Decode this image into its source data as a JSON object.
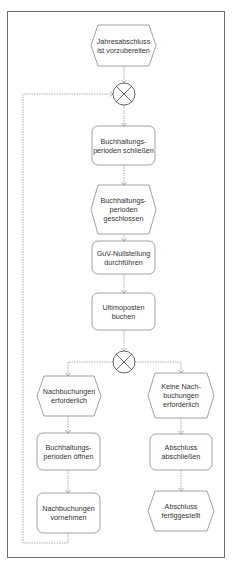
{
  "diagram": {
    "type": "EPC",
    "colors": {
      "stroke": "#8a8a8a",
      "frame": "#6e6e6e",
      "text": "#333333",
      "connector": "#9a9a9a"
    },
    "nodes": {
      "event_start": {
        "kind": "event",
        "label": "Jahresabschluss\nist vorzubereiten"
      },
      "xor_join": {
        "kind": "xor-connector",
        "label": "XOR"
      },
      "func_close_periods": {
        "kind": "function",
        "label": "Buchhaltungs-\nperioden schließen"
      },
      "event_periods_closed": {
        "kind": "event",
        "label": "Buchhaltungs-\nperioden\ngeschlossen"
      },
      "func_guv": {
        "kind": "function",
        "label": "GuV-Nullstellung\ndurchführen"
      },
      "func_ultimo": {
        "kind": "function",
        "label": "Ultimoposten\nbuchen"
      },
      "xor_split": {
        "kind": "xor-connector",
        "label": "XOR"
      },
      "event_rebook_needed": {
        "kind": "event",
        "label": "Nachbuchungen\nerforderlich"
      },
      "func_open_periods": {
        "kind": "function",
        "label": "Buchhaltungs-\nperioden öffnen"
      },
      "func_do_rebook": {
        "kind": "function",
        "label": "Nachbuchungen\nvornehmen"
      },
      "event_no_rebook": {
        "kind": "event",
        "label": "Keine Nach-\nbuchungen\nerforderlich"
      },
      "func_finish": {
        "kind": "function",
        "label": "Abschluss\nabschließen"
      },
      "event_finished": {
        "kind": "event",
        "label": "Abschluss\nfertiggestellt"
      }
    },
    "edges": [
      [
        "event_start",
        "xor_join"
      ],
      [
        "xor_join",
        "func_close_periods"
      ],
      [
        "func_close_periods",
        "event_periods_closed"
      ],
      [
        "event_periods_closed",
        "func_guv"
      ],
      [
        "func_guv",
        "func_ultimo"
      ],
      [
        "func_ultimo",
        "xor_split"
      ],
      [
        "xor_split",
        "event_rebook_needed"
      ],
      [
        "xor_split",
        "event_no_rebook"
      ],
      [
        "event_rebook_needed",
        "func_open_periods"
      ],
      [
        "func_open_periods",
        "func_do_rebook"
      ],
      [
        "func_do_rebook",
        "xor_join"
      ],
      [
        "event_no_rebook",
        "func_finish"
      ],
      [
        "func_finish",
        "event_finished"
      ]
    ]
  }
}
